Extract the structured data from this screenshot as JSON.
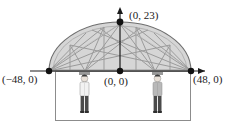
{
  "figure": {
    "labels": {
      "apex": "(0, 23)",
      "left_base": "(−48, 0)",
      "origin": "(0, 0)",
      "right_base": "(48, 0)"
    },
    "points": [
      {
        "name": "left-base-point",
        "label": "(−48, 0)",
        "x": -48,
        "y": 0
      },
      {
        "name": "origin-point",
        "label": "(0, 0)",
        "x": 0,
        "y": 0
      },
      {
        "name": "right-base-point",
        "label": "(48, 0)",
        "x": 48,
        "y": 0
      },
      {
        "name": "apex-point",
        "label": "(0, 23)",
        "x": 0,
        "y": 23
      }
    ],
    "axes": {
      "x_axis": {
        "from": -60,
        "to": 60,
        "arrow": "right"
      },
      "y_axis": {
        "from": 0,
        "to": 28,
        "arrow": "up"
      }
    },
    "arch": {
      "span": 96,
      "height": 23,
      "shape": "semi-ellipse",
      "fill_color": "#d6d6d6",
      "stroke_color": "#6e6e6e"
    },
    "colors": {
      "ink": "#1a1a1a",
      "arch_fill": "#d6d6d6",
      "arch_stroke": "#6e6e6e",
      "truss_line": "#9a9a9a",
      "frame": "#8c8c8c",
      "person_shirt_left": "#f2f2f2",
      "person_jacket_right": "#b9b9b9",
      "person_pants": "#4a4a4a",
      "person_hair": "#3a3a3a"
    },
    "people": [
      {
        "name": "person-left",
        "shirt": "light",
        "pants": "dark"
      },
      {
        "name": "person-right",
        "shirt": "gray",
        "pants": "dark"
      }
    ],
    "ground_frame": {
      "name": "ground-rectangle"
    }
  }
}
